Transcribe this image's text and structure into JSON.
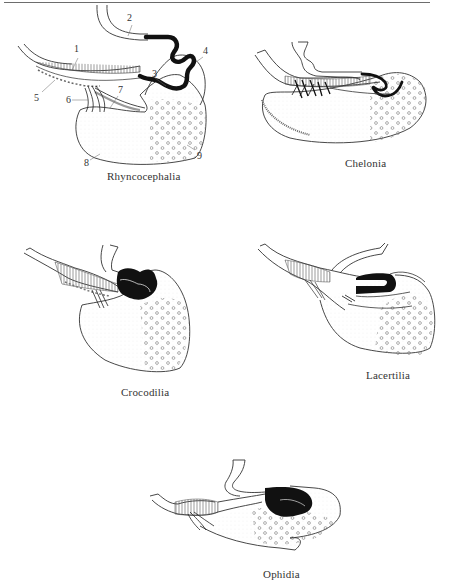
{
  "figure": {
    "panels": [
      {
        "id": "rhyncocephalia",
        "caption": "Rhyncocephalia",
        "labels": [
          "1",
          "2",
          "3",
          "4",
          "5",
          "6",
          "7",
          "8",
          "9"
        ]
      },
      {
        "id": "chelonia",
        "caption": "Chelonia"
      },
      {
        "id": "crocodilia",
        "caption": "Crocodilia"
      },
      {
        "id": "lacertilia",
        "caption": "Lacertilia"
      },
      {
        "id": "ophidia",
        "caption": "Ophidia"
      }
    ]
  }
}
